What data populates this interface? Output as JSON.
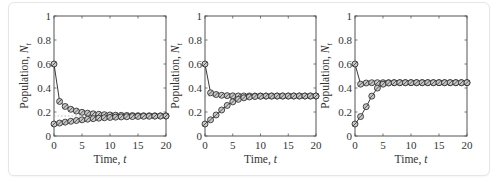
{
  "figure": {
    "style": {
      "axis_color": "#555555",
      "line_color": "#222222",
      "marker_fill": "#c8c8c8",
      "marker_stroke": "#222222",
      "equilibrium_line_color": "#999999",
      "card_border": "#e6e6e6"
    }
  },
  "chart_data": [
    {
      "type": "line",
      "panel": 1,
      "title": "",
      "xlabel": "Time, t",
      "ylabel": "Population, N_t",
      "xlim": [
        0,
        20
      ],
      "ylim": [
        0,
        1
      ],
      "xticks": [
        0,
        5,
        10,
        15,
        20
      ],
      "yticks": [
        0,
        0.2,
        0.4,
        0.6,
        0.8,
        1
      ],
      "ytick_labels": [
        "0",
        "0.2",
        "0.4",
        "0.6",
        "0.8",
        "1"
      ],
      "grid": false,
      "equilibrium": 0.1667,
      "x": [
        0,
        1,
        2,
        3,
        4,
        5,
        6,
        7,
        8,
        9,
        10,
        11,
        12,
        13,
        14,
        15,
        16,
        17,
        18,
        19,
        20
      ],
      "series": [
        {
          "name": "N0 = 0.6",
          "values": [
            0.6,
            0.288,
            0.2461,
            0.2226,
            0.2077,
            0.1975,
            0.1902,
            0.1848,
            0.1808,
            0.1777,
            0.1753,
            0.1735,
            0.1721,
            0.171,
            0.1701,
            0.1694,
            0.1688,
            0.1684,
            0.168,
            0.1678,
            0.1676
          ]
        },
        {
          "name": "N0 = 0.1",
          "values": [
            0.1,
            0.108,
            0.1156,
            0.1227,
            0.1292,
            0.135,
            0.1401,
            0.1446,
            0.1485,
            0.1518,
            0.1546,
            0.157,
            0.1589,
            0.1606,
            0.162,
            0.1631,
            0.1641,
            0.1648,
            0.1655,
            0.166,
            0.1664
          ]
        }
      ]
    },
    {
      "type": "line",
      "panel": 2,
      "title": "",
      "xlabel": "Time, t",
      "ylabel": "Population, N_t",
      "xlim": [
        0,
        20
      ],
      "ylim": [
        0,
        1
      ],
      "xticks": [
        0,
        5,
        10,
        15,
        20
      ],
      "yticks": [
        0,
        0.2,
        0.4,
        0.6,
        0.8,
        1
      ],
      "ytick_labels": [
        "0",
        "0.2",
        "0.4",
        "0.6",
        "0.8",
        "1"
      ],
      "grid": false,
      "equilibrium": 0.3333,
      "x": [
        0,
        1,
        2,
        3,
        4,
        5,
        6,
        7,
        8,
        9,
        10,
        11,
        12,
        13,
        14,
        15,
        16,
        17,
        18,
        19,
        20
      ],
      "series": [
        {
          "name": "N0 = 0.6",
          "values": [
            0.6,
            0.36,
            0.3456,
            0.3392,
            0.3362,
            0.3347,
            0.334,
            0.3337,
            0.3335,
            0.3334,
            0.3334,
            0.3333,
            0.3333,
            0.3333,
            0.3333,
            0.3333,
            0.3333,
            0.3333,
            0.3333,
            0.3333,
            0.3333
          ]
        },
        {
          "name": "N0 = 0.1",
          "values": [
            0.1,
            0.135,
            0.1752,
            0.2167,
            0.2546,
            0.2846,
            0.3054,
            0.3182,
            0.3254,
            0.3293,
            0.3313,
            0.3323,
            0.3328,
            0.3331,
            0.3332,
            0.3332,
            0.3333,
            0.3333,
            0.3333,
            0.3333,
            0.3333
          ]
        }
      ]
    },
    {
      "type": "line",
      "panel": 3,
      "title": "",
      "xlabel": "Time, t",
      "ylabel": "Population, N_t",
      "xlim": [
        0,
        20
      ],
      "ylim": [
        0,
        1
      ],
      "xticks": [
        0,
        5,
        10,
        15,
        20
      ],
      "yticks": [
        0,
        0.2,
        0.4,
        0.6,
        0.8,
        1
      ],
      "ytick_labels": [
        "0",
        "0.2",
        "0.4",
        "0.6",
        "0.8",
        "1"
      ],
      "grid": false,
      "equilibrium": 0.4444,
      "x": [
        0,
        1,
        2,
        3,
        4,
        5,
        6,
        7,
        8,
        9,
        10,
        11,
        12,
        13,
        14,
        15,
        16,
        17,
        18,
        19,
        20
      ],
      "series": [
        {
          "name": "N0 = 0.6",
          "values": [
            0.6,
            0.432,
            0.4417,
            0.4439,
            0.4443,
            0.4444,
            0.4444,
            0.4444,
            0.4444,
            0.4444,
            0.4444,
            0.4444,
            0.4444,
            0.4444,
            0.4444,
            0.4444,
            0.4444,
            0.4444,
            0.4444,
            0.4444,
            0.4444
          ]
        },
        {
          "name": "N0 = 0.1",
          "values": [
            0.1,
            0.162,
            0.2444,
            0.3324,
            0.3994,
            0.4318,
            0.4417,
            0.4439,
            0.4443,
            0.4444,
            0.4444,
            0.4444,
            0.4444,
            0.4444,
            0.4444,
            0.4444,
            0.4444,
            0.4444,
            0.4444,
            0.4444,
            0.4444
          ]
        }
      ]
    }
  ]
}
